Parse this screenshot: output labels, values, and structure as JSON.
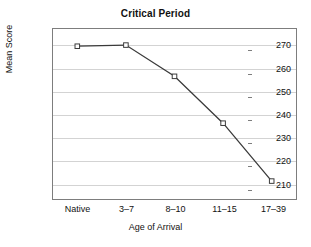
{
  "chart_data": {
    "type": "line",
    "title": "Critical Period",
    "xlabel": "Age of Arrival",
    "ylabel": "Mean Score",
    "categories": [
      "Native",
      "3–7",
      "8–10",
      "11–15",
      "17–39"
    ],
    "values": [
      269.5,
      270,
      256.4,
      236,
      210.8
    ],
    "ytick_labels": [
      "270",
      "260",
      "250",
      "240",
      "230",
      "220",
      "210"
    ],
    "ytick_values": [
      270,
      260,
      250,
      240,
      230,
      220,
      210
    ],
    "ylim": [
      203,
      277
    ],
    "grid": "horizontal",
    "legend": "none",
    "marker": "open-square",
    "line_color": "#3a3a3a",
    "marker_fill": "#ffffff",
    "marker_edge": "#3a3a3a",
    "grid_color": "#d3d3d3",
    "frame_color": "#7d7d7d"
  }
}
